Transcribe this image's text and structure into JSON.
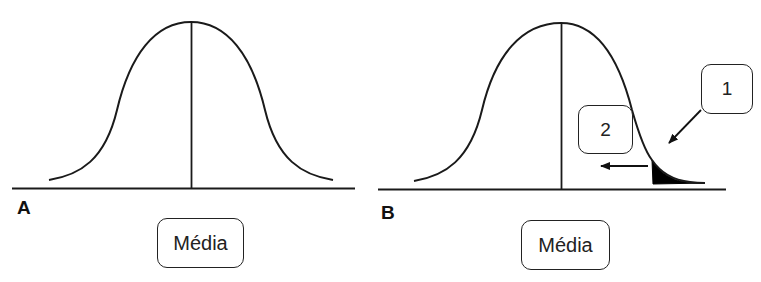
{
  "panels": {
    "a": {
      "label": "A",
      "mean_label": "Média"
    },
    "b": {
      "label": "B",
      "mean_label": "Média",
      "callout_1": "1",
      "callout_2": "2"
    }
  },
  "colors": {
    "line": "#1a1a1a",
    "box_border": "#222222",
    "shaded_tail": "#000000",
    "background": "#ffffff"
  },
  "icons": {
    "arrow_1": "arrow-down-left-icon",
    "arrow_2": "arrow-left-icon"
  }
}
